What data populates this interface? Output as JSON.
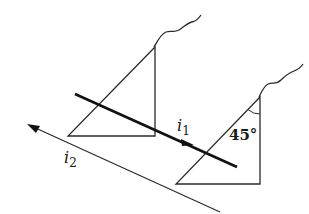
{
  "diagram": {
    "type": "optics-prism-refraction",
    "colors": {
      "stroke": "#2a2a2a",
      "ray": "#111111",
      "background": "#ffffff"
    },
    "labels": {
      "incident_ray": "i",
      "incident_sub": "1",
      "emergent_ray": "i",
      "emergent_sub": "2",
      "angle": "45°"
    },
    "elements": {
      "prism_left": {
        "apex": [
          155,
          47
        ],
        "bottom_left": [
          68,
          136
        ],
        "bottom_right": [
          155,
          136
        ]
      },
      "prism_right": {
        "apex": [
          260,
          97
        ],
        "bottom_left": [
          176,
          184
        ],
        "bottom_right": [
          260,
          184
        ]
      },
      "ray_i1": {
        "from": [
          75,
          94
        ],
        "to": [
          237,
          167
        ],
        "arrow_at": [
          190,
          143
        ]
      },
      "ray_i2": {
        "from": [
          220,
          212
        ],
        "to": [
          27,
          124
        ]
      }
    }
  }
}
